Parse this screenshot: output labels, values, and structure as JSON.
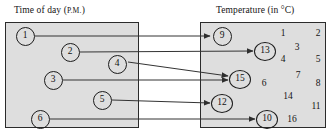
{
  "figure": {
    "type": "mapping-diagram",
    "background_color": "#ffffff",
    "box_fill_color": "#dedede",
    "box_border_color": "#2b2b2b",
    "line_color": "#333333"
  },
  "left_set": {
    "title_main": "Time of day (",
    "title_smallcaps": "P.M.",
    "title_tail": ")",
    "title_full": "Time of day (P.M.)",
    "nodes": [
      {
        "label": "1",
        "cx": 25,
        "cy": 36
      },
      {
        "label": "2",
        "cx": 70,
        "cy": 52
      },
      {
        "label": "4",
        "cx": 117,
        "cy": 64
      },
      {
        "label": "3",
        "cx": 53,
        "cy": 80
      },
      {
        "label": "5",
        "cx": 102,
        "cy": 100
      },
      {
        "label": "6",
        "cx": 40,
        "cy": 119
      }
    ]
  },
  "right_set": {
    "title_main": "Temperature (in ",
    "title_unit": "°C",
    "title_tail": ")",
    "title_full": "Temperature (in °C)",
    "nodes": [
      {
        "label": "9",
        "cx": 222,
        "cy": 36
      },
      {
        "label": "13",
        "cx": 265,
        "cy": 51
      },
      {
        "label": "15",
        "cx": 240,
        "cy": 79
      },
      {
        "label": "12",
        "cx": 222,
        "cy": 103
      },
      {
        "label": "10",
        "cx": 267,
        "cy": 119
      }
    ],
    "loose_numbers": [
      {
        "label": "1",
        "cx": 283,
        "cy": 34
      },
      {
        "label": "2",
        "cx": 318,
        "cy": 34
      },
      {
        "label": "3",
        "cx": 297,
        "cy": 48
      },
      {
        "label": "4",
        "cx": 283,
        "cy": 60
      },
      {
        "label": "5",
        "cx": 318,
        "cy": 60
      },
      {
        "label": "7",
        "cx": 298,
        "cy": 76
      },
      {
        "label": "6",
        "cx": 264,
        "cy": 84
      },
      {
        "label": "8",
        "cx": 318,
        "cy": 84
      },
      {
        "label": "14",
        "cx": 288,
        "cy": 97
      },
      {
        "label": "11",
        "cx": 316,
        "cy": 107
      },
      {
        "label": "16",
        "cx": 292,
        "cy": 120
      }
    ]
  },
  "mappings": [
    {
      "from": "1",
      "to": "9",
      "x1": 35,
      "y1": 36,
      "x2": 210,
      "y2": 36
    },
    {
      "from": "2",
      "to": "13",
      "x1": 80,
      "y1": 52,
      "x2": 253,
      "y2": 51
    },
    {
      "from": "4",
      "to": "15",
      "x1": 128,
      "y1": 62,
      "x2": 228,
      "y2": 76
    },
    {
      "from": "3",
      "to": "15",
      "x1": 63,
      "y1": 80,
      "x2": 228,
      "y2": 80
    },
    {
      "from": "5",
      "to": "12",
      "x1": 112,
      "y1": 100,
      "x2": 210,
      "y2": 103
    },
    {
      "from": "6",
      "to": "10",
      "x1": 50,
      "y1": 119,
      "x2": 255,
      "y2": 119
    }
  ]
}
